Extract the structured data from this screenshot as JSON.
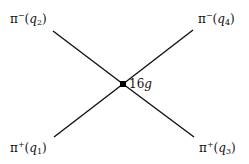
{
  "diagram": {
    "type": "feynman-vertex",
    "vertex": {
      "label": "16g",
      "coefficient": "16",
      "coupling": "g"
    },
    "legs": [
      {
        "position": "top-left",
        "particle": "π",
        "charge": "−",
        "momentum": "q",
        "index": "2"
      },
      {
        "position": "top-right",
        "particle": "π",
        "charge": "−",
        "momentum": "q",
        "index": "4"
      },
      {
        "position": "bottom-left",
        "particle": "π",
        "charge": "+",
        "momentum": "q",
        "index": "1"
      },
      {
        "position": "bottom-right",
        "particle": "π",
        "charge": "+",
        "momentum": "q",
        "index": "3"
      }
    ]
  }
}
